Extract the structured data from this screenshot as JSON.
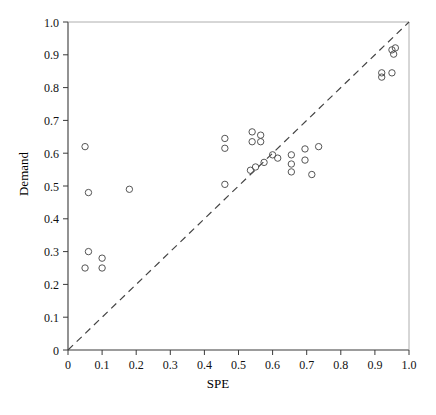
{
  "header": {
    "left_faint_text": "",
    "center_faint_text": ""
  },
  "chart_data": {
    "type": "scatter",
    "title": "",
    "xlabel": "SPE",
    "ylabel": "Demand",
    "xlim": [
      0,
      1.0
    ],
    "ylim": [
      0,
      1.0
    ],
    "grid": false,
    "legend": null,
    "marker": {
      "shape": "open-circle",
      "radius_px": 3.2,
      "stroke": "#555555",
      "fill": "none"
    },
    "reference_line": {
      "name": "y = x identity line",
      "style": "dashed",
      "color": "#444444",
      "from": [
        0,
        0
      ],
      "to": [
        1.0,
        1.0
      ]
    },
    "xticks": [
      "0",
      "0.1",
      "0.2",
      "0.3",
      "0.4",
      "0.5",
      "0.6",
      "0.7",
      "0.8",
      "0.9",
      "1.0"
    ],
    "xtickvalues": [
      0,
      0.1,
      0.2,
      0.3,
      0.4,
      0.5,
      0.6,
      0.7,
      0.8,
      0.9,
      1.0
    ],
    "yticks": [
      "0",
      "0.1",
      "0.2",
      "0.3",
      "0.4",
      "0.5",
      "0.6",
      "0.7",
      "0.8",
      "0.9",
      "1.0"
    ],
    "ytickvalues": [
      0,
      0.1,
      0.2,
      0.3,
      0.4,
      0.5,
      0.6,
      0.7,
      0.8,
      0.9,
      1.0
    ],
    "x": [
      0.05,
      0.06,
      0.18,
      0.06,
      0.1,
      0.05,
      0.1,
      0.46,
      0.46,
      0.46,
      0.54,
      0.54,
      0.565,
      0.565,
      0.535,
      0.55,
      0.575,
      0.6,
      0.615,
      0.655,
      0.655,
      0.655,
      0.695,
      0.695,
      0.715,
      0.735,
      0.92,
      0.92,
      0.95,
      0.95,
      0.955,
      0.96
    ],
    "y": [
      0.62,
      0.48,
      0.49,
      0.3,
      0.28,
      0.25,
      0.25,
      0.645,
      0.615,
      0.505,
      0.665,
      0.635,
      0.655,
      0.635,
      0.548,
      0.558,
      0.572,
      0.595,
      0.585,
      0.595,
      0.567,
      0.543,
      0.613,
      0.579,
      0.535,
      0.62,
      0.845,
      0.832,
      0.845,
      0.915,
      0.902,
      0.921
    ]
  }
}
